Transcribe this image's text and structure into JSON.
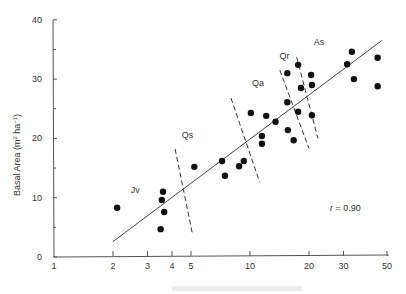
{
  "chart_data": {
    "type": "scatter",
    "title": "",
    "xlabel": "",
    "ylabel": "Basal Area (m² ha⁻¹)",
    "xscale": "log",
    "xlim": [
      1,
      50
    ],
    "ylim": [
      0,
      40
    ],
    "x_ticks": [
      1,
      2,
      3,
      4,
      5,
      10,
      20,
      30,
      50
    ],
    "y_ticks": [
      0,
      10,
      20,
      30,
      40
    ],
    "y_minor_ticks": [
      5,
      15,
      25,
      35
    ],
    "grid": false,
    "legend": null,
    "series": [
      {
        "name": "stands",
        "marker": "filled-circle",
        "points": [
          [
            2.1,
            8.3
          ],
          [
            3.6,
            11.0
          ],
          [
            3.55,
            9.6
          ],
          [
            3.65,
            7.6
          ],
          [
            3.5,
            4.7
          ],
          [
            5.2,
            15.2
          ],
          [
            7.2,
            16.2
          ],
          [
            7.45,
            13.7
          ],
          [
            8.8,
            15.3
          ],
          [
            9.3,
            16.2
          ],
          [
            10.1,
            24.3
          ],
          [
            11.5,
            20.4
          ],
          [
            11.5,
            19.1
          ],
          [
            12.1,
            23.8
          ],
          [
            13.5,
            22.8
          ],
          [
            15.5,
            31.0
          ],
          [
            15.5,
            26.1
          ],
          [
            15.6,
            21.4
          ],
          [
            16.7,
            19.7
          ],
          [
            17.6,
            32.4
          ],
          [
            17.6,
            24.5
          ],
          [
            18.2,
            28.5
          ],
          [
            20.5,
            30.7
          ],
          [
            20.7,
            29.0
          ],
          [
            20.7,
            23.9
          ],
          [
            31.3,
            32.5
          ],
          [
            33.1,
            34.6
          ],
          [
            33.9,
            30.0
          ],
          [
            44.8,
            33.6
          ],
          [
            44.8,
            28.8
          ]
        ]
      }
    ],
    "regression_line": {
      "from": [
        2.0,
        2.6
      ],
      "to": [
        47,
        36.5
      ]
    },
    "correlation": "r = 0.90",
    "zones": [
      {
        "label": "Jv",
        "at": [
          2.6,
          10.8
        ]
      },
      {
        "label": "Qs",
        "at": [
          4.8,
          20.0
        ]
      },
      {
        "label": "Qa",
        "at": [
          11.0,
          28.8
        ]
      },
      {
        "label": "Qr",
        "at": [
          15.0,
          33.4
        ]
      },
      {
        "label": "As",
        "at": [
          22.5,
          35.7
        ]
      }
    ],
    "zone_boundaries": [
      {
        "from": [
          4.15,
          18.2
        ],
        "to": [
          5.1,
          3.7
        ]
      },
      {
        "from": [
          8.0,
          26.8
        ],
        "to": [
          11.2,
          12.6
        ]
      },
      {
        "from": [
          14.2,
          31.5
        ],
        "to": [
          20.0,
          18.3
        ]
      },
      {
        "from": [
          17.3,
          33.7
        ],
        "to": [
          22.2,
          20.0
        ]
      }
    ]
  },
  "labels": {
    "ylabel_main": "Basal Area (m",
    "ylabel_sup1": "2",
    "ylabel_mid": " ha",
    "ylabel_sup2": "−1",
    "ylabel_end": ")",
    "correlation_r": "r",
    "correlation_rest": " = 0.90",
    "x_ticks": [
      "1",
      "2",
      "3",
      "4",
      "5",
      "10",
      "20",
      "30",
      "50"
    ],
    "y_ticks": [
      "0",
      "10",
      "20",
      "30",
      "40"
    ],
    "zones": [
      "Jv",
      "Qs",
      "Qa",
      "Qr",
      "As"
    ]
  }
}
